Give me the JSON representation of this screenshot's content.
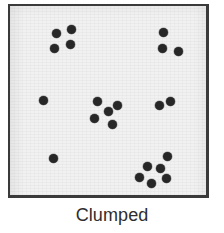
{
  "figure": {
    "caption": "Clumped",
    "panel": {
      "background_color": "#f1f1f1",
      "border_color": "#3a3a3a",
      "x": 8,
      "y": 4,
      "width": 201,
      "height": 194
    },
    "dot_color": "#272727",
    "dot_diameter": 9,
    "total_points": 21
  },
  "chart_data": {
    "type": "scatter",
    "title": "Clumped",
    "subtitle": "",
    "xlabel": "",
    "ylabel": "",
    "xlim": [
      0,
      201
    ],
    "ylim": [
      0,
      194
    ],
    "grid": false,
    "legend": "none",
    "marker": "filled-circle",
    "marker_size": 9,
    "marker_color": "#272727",
    "annotation": "Clumped dispersion pattern: individuals aggregated into discrete groups with empty space between",
    "clusters": [
      {
        "name": "top-left-cluster",
        "count": 4,
        "points": [
          {
            "x": 46,
            "y": 27
          },
          {
            "x": 61,
            "y": 23
          },
          {
            "x": 60,
            "y": 38
          },
          {
            "x": 44,
            "y": 42
          }
        ]
      },
      {
        "name": "top-right-cluster",
        "count": 3,
        "points": [
          {
            "x": 153,
            "y": 26
          },
          {
            "x": 152,
            "y": 42
          },
          {
            "x": 168,
            "y": 45
          }
        ]
      },
      {
        "name": "center-cluster",
        "count": 5,
        "points": [
          {
            "x": 87,
            "y": 95
          },
          {
            "x": 107,
            "y": 99
          },
          {
            "x": 98,
            "y": 105
          },
          {
            "x": 84,
            "y": 112
          },
          {
            "x": 102,
            "y": 118
          }
        ]
      },
      {
        "name": "right-middle-pair",
        "count": 2,
        "points": [
          {
            "x": 149,
            "y": 99
          },
          {
            "x": 160,
            "y": 95
          }
        ]
      },
      {
        "name": "bottom-right-cluster",
        "count": 6,
        "points": [
          {
            "x": 157,
            "y": 150
          },
          {
            "x": 137,
            "y": 160
          },
          {
            "x": 150,
            "y": 162
          },
          {
            "x": 129,
            "y": 171
          },
          {
            "x": 156,
            "y": 172
          },
          {
            "x": 141,
            "y": 177
          }
        ]
      },
      {
        "name": "isolated-points",
        "count": 1,
        "points": [
          {
            "x": 33,
            "y": 94
          }
        ]
      },
      {
        "name": "isolated-points-lower",
        "count": 1,
        "points": [
          {
            "x": 43,
            "y": 152
          }
        ]
      }
    ]
  }
}
